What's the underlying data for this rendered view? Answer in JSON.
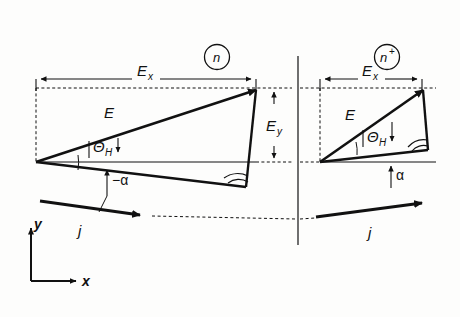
{
  "figure": {
    "background_color": "#fdfdfc",
    "ink_color": "#111111",
    "width": 460,
    "height": 317
  },
  "regions": [
    {
      "id": "left",
      "badge_label": "n",
      "badge_superscript": "",
      "vector_label": "E",
      "x_component_label": "E",
      "x_component_sub": "x",
      "y_component_label": "E",
      "y_component_sub": "y",
      "hall_angle_label": "Θ",
      "hall_angle_sub": "H",
      "tilt_angle_label": "−α",
      "current_label": "j"
    },
    {
      "id": "right",
      "badge_label": "n",
      "badge_superscript": "+",
      "vector_label": "E",
      "x_component_label": "E",
      "x_component_sub": "x",
      "hall_angle_label": "Θ",
      "hall_angle_sub": "H",
      "tilt_angle_label": "α",
      "current_label": "j"
    }
  ],
  "axes": {
    "x_label": "x",
    "y_label": "y"
  }
}
